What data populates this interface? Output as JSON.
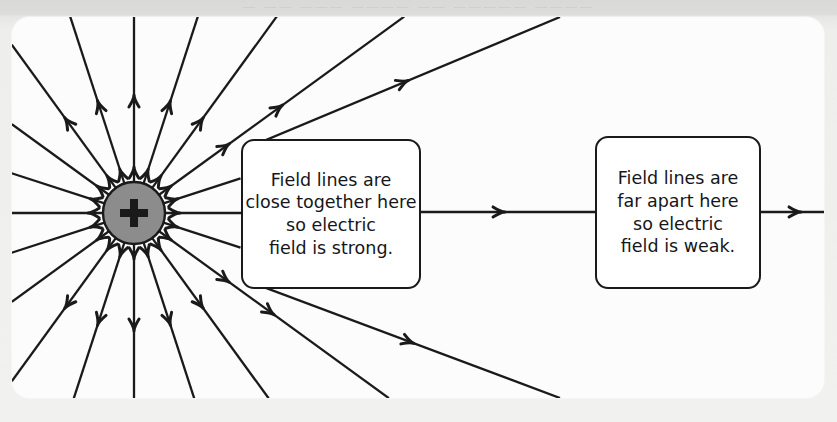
{
  "figure": {
    "name": "electric-field-lines-point-charge",
    "background_color": "#eeeeec",
    "card_color": "#fcfcfc",
    "ink_color": "#1a1a1a"
  },
  "charge": {
    "name": "positive-point-charge",
    "symbol": "+",
    "fill_color": "#8c8c8c",
    "stroke_color": "#1a1a1a",
    "center_x": 134,
    "center_y": 213,
    "radius": 31
  },
  "callouts": [
    {
      "id": "strong",
      "lines": [
        "Field lines are",
        "close together here",
        "so electric",
        "field is strong."
      ]
    },
    {
      "id": "weak",
      "lines": [
        "Field lines are",
        "far apart here",
        "so electric",
        "field is weak."
      ]
    }
  ],
  "bleed_text": {
    "row1": "— ——  ———  ————  —— —————  ————"
  },
  "chart_data": {
    "type": "diagram",
    "charge_sign": "positive",
    "charge_center": [
      134,
      213
    ],
    "charge_radius": 31,
    "field_line_angles_deg": [
      0,
      18,
      36,
      54,
      72,
      90,
      108,
      126,
      144,
      162,
      180,
      198,
      216,
      234,
      252,
      270,
      288,
      306,
      324,
      342
    ],
    "arrow_direction": "outward",
    "inner_arrow_radius": 46,
    "outer_arrow_radius": 118,
    "annotations": [
      {
        "text": "Field lines are close together here so electric field is strong.",
        "points_to": "region adjacent to the charge",
        "box": [
          241,
          139,
          180,
          150
        ]
      },
      {
        "text": "Field lines are far apart here so electric field is weak.",
        "points_to": "region distant from the charge",
        "box": [
          595,
          136,
          166,
          153
        ]
      }
    ]
  }
}
